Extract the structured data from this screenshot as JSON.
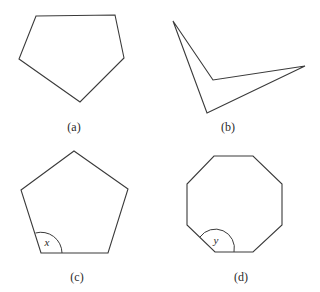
{
  "figures": [
    {
      "id": "a",
      "label": "(a)",
      "shape": "irregular-pentagon",
      "points": "36,16 115,15 124,58 80,102 19,59",
      "label_pos": [
        74,
        131
      ]
    },
    {
      "id": "b",
      "label": "(b)",
      "shape": "concave-quadrilateral",
      "points": "173,21 213,80 305,66 207,113",
      "label_pos": [
        228,
        131
      ]
    },
    {
      "id": "c",
      "label": "(c)",
      "shape": "regular-pentagon",
      "points": "74,151 128,189 108,253 41,253 21,190",
      "angle_label": "x",
      "angle_vertex": [
        41,
        253
      ],
      "angle_arc": "M 62 253 A 21 21 0 0 0 35.5 233",
      "angle_label_pos": [
        47,
        246
      ],
      "label_pos": [
        77,
        281
      ]
    },
    {
      "id": "d",
      "label": "(d)",
      "shape": "regular-octagon",
      "points": "214,156 253,156 282,184 282,225 253,252 215,252 187,225 187,184",
      "angle_label": "y",
      "angle_vertex": [
        215,
        252
      ],
      "angle_arc": "M 234 252 A 19 19 0 0 0 200 237",
      "angle_label_pos": [
        216,
        244
      ],
      "label_pos": [
        241,
        281
      ]
    }
  ]
}
